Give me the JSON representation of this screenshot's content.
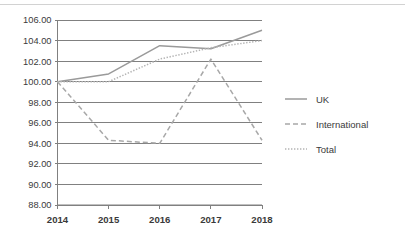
{
  "chart_data": {
    "type": "line",
    "title": "",
    "subtitle": "",
    "xlabel": "",
    "ylabel": "",
    "x": [
      2014,
      2015,
      2016,
      2017,
      2018
    ],
    "categories": [
      "2014",
      "2015",
      "2016",
      "2017",
      "2018"
    ],
    "xtick_labels": [
      "2014",
      "2015",
      "2016",
      "2017",
      "2018"
    ],
    "ytick_labels": [
      "88.00",
      "90.00",
      "92.00",
      "94.00",
      "96.00",
      "98.00",
      "100.00",
      "102.00",
      "104.00",
      "106.00"
    ],
    "ytick_values": [
      88,
      90,
      92,
      94,
      96,
      98,
      100,
      102,
      104,
      106
    ],
    "ylim": [
      88,
      106
    ],
    "xlim": [
      2014,
      2018
    ],
    "ytick_step": 2,
    "grid": true,
    "grid_axis": "y",
    "legend_position": "right",
    "series": [
      {
        "name": "UK",
        "style": "solid",
        "color": "#9a9a9a",
        "values": [
          100.0,
          100.75,
          103.5,
          103.2,
          105.0
        ]
      },
      {
        "name": "International",
        "style": "dashed",
        "color": "#a8a8a8",
        "values": [
          100.0,
          94.3,
          94.0,
          102.2,
          94.3
        ]
      },
      {
        "name": "Total",
        "style": "dotted",
        "color": "#b4b4b4",
        "values": [
          100.0,
          100.0,
          102.2,
          103.3,
          104.0
        ]
      }
    ]
  },
  "legend": {
    "entries": [
      {
        "label": "UK"
      },
      {
        "label": "International"
      },
      {
        "label": "Total"
      }
    ]
  },
  "colors": {
    "grid": "#808080",
    "axis": "#808080",
    "text": "#3a3a3a",
    "background": "#ffffff",
    "top_rule": "#d2d2d2"
  }
}
